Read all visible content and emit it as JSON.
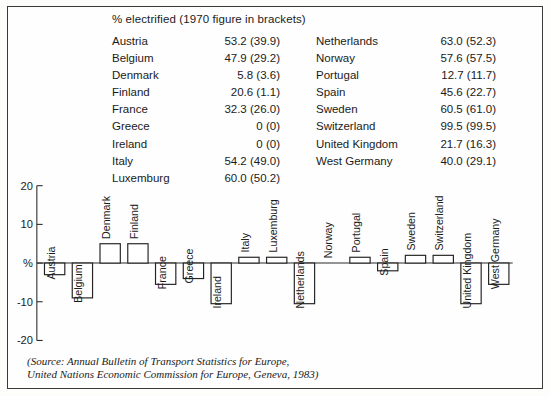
{
  "figure": {
    "caption": "% electrified (1970 figure in brackets)",
    "source_line_1": "(Source: Annual Bulletin of Transport Statistics for Europe,",
    "source_line_2": "United Nations Economic Commission for Europe, Geneva, 1983)"
  },
  "table": {
    "left_column": [
      {
        "country": "Austria",
        "value": "53.2 (39.9)"
      },
      {
        "country": "Belgium",
        "value": "47.9 (29.2)"
      },
      {
        "country": "Denmark",
        "value": "5.8 (3.6)"
      },
      {
        "country": "Finland",
        "value": "20.6 (1.1)"
      },
      {
        "country": "France",
        "value": "32.3 (26.0)"
      },
      {
        "country": "Greece",
        "value": "0 (0)"
      },
      {
        "country": "Ireland",
        "value": "0 (0)"
      },
      {
        "country": "Italy",
        "value": "54.2 (49.0)"
      },
      {
        "country": "Luxemburg",
        "value": "60.0 (50.2)"
      }
    ],
    "right_column": [
      {
        "country": "Netherlands",
        "value": "63.0 (52.3)"
      },
      {
        "country": "Norway",
        "value": "57.6 (57.5)"
      },
      {
        "country": "Portugal",
        "value": "12.7 (11.7)"
      },
      {
        "country": "Spain",
        "value": "45.6 (22.7)"
      },
      {
        "country": "Sweden",
        "value": "60.5 (61.0)"
      },
      {
        "country": "Switzerland",
        "value": "99.5 (99.5)"
      },
      {
        "country": "United Kingdom",
        "value": "21.7 (16.3)"
      },
      {
        "country": "West Germany",
        "value": "40.0 (29.1)"
      }
    ]
  },
  "chart_data": {
    "type": "bar",
    "title": "",
    "xlabel": "",
    "ylabel": "%",
    "ylim": [
      -20,
      20
    ],
    "ytick_labels": [
      "20",
      "10",
      "%",
      "-10",
      "-20"
    ],
    "ytick_values": [
      20,
      10,
      0,
      -10,
      -20
    ],
    "grid": false,
    "legend": "none",
    "categories": [
      "Austria",
      "Belgium",
      "Denmark",
      "Finland",
      "France",
      "Greece",
      "Ireland",
      "Italy",
      "Luxemburg",
      "Netherlands",
      "Norway",
      "Portugal",
      "Spain",
      "Sweden",
      "Switzerland",
      "United Kingdom",
      "West Germany"
    ],
    "values": [
      -3.0,
      -9.0,
      5.0,
      5.0,
      -5.5,
      -4.0,
      -10.5,
      1.5,
      1.5,
      -10.5,
      0.0,
      1.5,
      -2.0,
      2.0,
      2.0,
      -10.5,
      -5.5
    ]
  }
}
